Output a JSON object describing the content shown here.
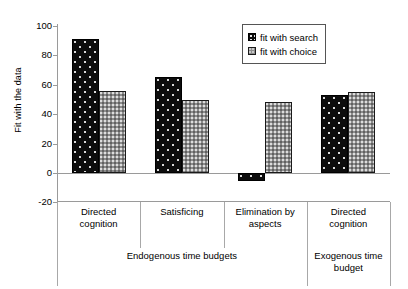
{
  "chart_data": {
    "type": "bar",
    "title": "",
    "xlabel": "",
    "ylabel": "Fit with the data",
    "ylim": [
      -20,
      100
    ],
    "yticks": [
      100,
      80,
      60,
      40,
      20,
      0,
      -20
    ],
    "grid": false,
    "legend_position": "top-right",
    "categories": [
      "Directed cognition",
      "Satisficing",
      "Elimination by aspects",
      "Directed cognition"
    ],
    "category_lines": [
      [
        "Directed",
        "cognition"
      ],
      [
        "Satisficing"
      ],
      [
        "Elimination by",
        "aspects"
      ],
      [
        "Directed",
        "cognition"
      ]
    ],
    "groups": [
      {
        "label": "Endogenous time budgets",
        "lines": [
          "Endogenous time budgets"
        ],
        "span": 3
      },
      {
        "label": "Exogenous time budget",
        "lines": [
          "Exogenous time",
          "budget"
        ],
        "span": 1
      }
    ],
    "series": [
      {
        "name": "fit with search",
        "values": [
          91,
          65,
          -5.5,
          53
        ],
        "color": "#0d0d0d"
      },
      {
        "name": "fit with choice",
        "values": [
          56,
          49.5,
          48,
          55
        ],
        "color": "#8c8c8c"
      }
    ]
  },
  "legend": {
    "entries": [
      {
        "label": "fit with search"
      },
      {
        "label": "fit with choice"
      }
    ]
  },
  "axis": {
    "y_title": "Fit with the data",
    "y_tick_labels": [
      "100",
      "80",
      "60",
      "40",
      "20",
      "0",
      "-20"
    ]
  }
}
